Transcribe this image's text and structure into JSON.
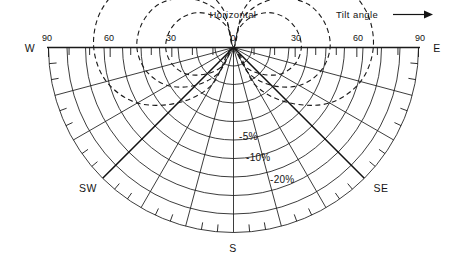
{
  "figure": {
    "title_top": "Horizontal",
    "legend_note": "Tilt angle",
    "legend_arrow_icon": "right-arrow-icon"
  },
  "axis": {
    "tick_labels": [
      "90",
      "60",
      "30",
      "0",
      "30",
      "60",
      "90"
    ],
    "tick_values": [
      -90,
      -60,
      -30,
      0,
      30,
      60,
      90
    ],
    "minor_tick_step_deg": 10
  },
  "compass": {
    "west": "W",
    "southwest": "SW",
    "south": "S",
    "southeast": "SE",
    "east": "E"
  },
  "contours": [
    {
      "label": "-5%",
      "loss_pct": 5
    },
    {
      "label": "-10%",
      "loss_pct": 10
    },
    {
      "label": "-20%",
      "loss_pct": 20
    }
  ],
  "colors": {
    "ink": "#1a1a1a",
    "background": "#ffffff"
  },
  "chart_data": {
    "type": "line",
    "title": "Horizontal",
    "subtitle": "Tilt angle",
    "projection": "polar-semicircle",
    "xlabel": "Tilt angle (degrees)",
    "ylabel": "Azimuth (compass direction)",
    "grid": true,
    "legend_position": "inline-annotations",
    "axis_ranges": {
      "tilt_deg": [
        0,
        90
      ],
      "azimuth_deg": [
        -90,
        90
      ]
    },
    "radial_tick_labels": [
      "90",
      "60",
      "30",
      "0",
      "30",
      "60",
      "90"
    ],
    "radial_tick_values": [
      -90,
      -60,
      -30,
      0,
      30,
      60,
      90
    ],
    "azimuth_tick_labels": [
      "W",
      "SW",
      "S",
      "SE",
      "E"
    ],
    "azimuth_tick_values": [
      -90,
      -45,
      0,
      45,
      90
    ],
    "grid_arcs_tilt_deg": [
      9,
      18,
      27,
      36,
      45,
      54,
      63,
      72,
      81,
      90
    ],
    "grid_rays_azimuth_deg": [
      -90,
      -75,
      -60,
      -45,
      -30,
      -15,
      0,
      15,
      30,
      45,
      60,
      75,
      90
    ],
    "major_rays_azimuth_deg": [
      -45,
      45
    ],
    "series": [
      {
        "name": "-5%",
        "annotation": "-5%",
        "style": "dashed",
        "closed": true,
        "points_polar_tilt_azimuth": [
          [
            0,
            0
          ],
          [
            10,
            30
          ],
          [
            18,
            45
          ],
          [
            26,
            60
          ],
          [
            31,
            75
          ],
          [
            33,
            90
          ],
          [
            32,
            105
          ],
          [
            29,
            120
          ],
          [
            24,
            135
          ],
          [
            17,
            150
          ],
          [
            9,
            165
          ],
          [
            0,
            180
          ],
          [
            9,
            195
          ],
          [
            17,
            210
          ],
          [
            24,
            225
          ],
          [
            29,
            240
          ],
          [
            32,
            255
          ],
          [
            33,
            270
          ],
          [
            31,
            285
          ],
          [
            26,
            300
          ],
          [
            18,
            315
          ],
          [
            10,
            330
          ]
        ]
      },
      {
        "name": "-10%",
        "annotation": "-10%",
        "style": "dashed",
        "closed": true,
        "points_polar_tilt_azimuth": [
          [
            0,
            0
          ],
          [
            14,
            30
          ],
          [
            26,
            45
          ],
          [
            37,
            60
          ],
          [
            44,
            75
          ],
          [
            47,
            90
          ],
          [
            46,
            105
          ],
          [
            42,
            120
          ],
          [
            34,
            135
          ],
          [
            24,
            150
          ],
          [
            13,
            165
          ],
          [
            0,
            180
          ],
          [
            13,
            195
          ],
          [
            24,
            210
          ],
          [
            34,
            225
          ],
          [
            42,
            240
          ],
          [
            46,
            255
          ],
          [
            47,
            270
          ],
          [
            44,
            285
          ],
          [
            37,
            300
          ],
          [
            26,
            315
          ],
          [
            14,
            330
          ]
        ]
      },
      {
        "name": "-20%",
        "annotation": "-20%",
        "style": "dashed",
        "closed": true,
        "points_polar_tilt_azimuth": [
          [
            0,
            0
          ],
          [
            21,
            30
          ],
          [
            38,
            45
          ],
          [
            54,
            60
          ],
          [
            64,
            75
          ],
          [
            68,
            90
          ],
          [
            67,
            105
          ],
          [
            61,
            120
          ],
          [
            50,
            135
          ],
          [
            35,
            150
          ],
          [
            19,
            165
          ],
          [
            0,
            180
          ],
          [
            19,
            195
          ],
          [
            35,
            210
          ],
          [
            50,
            225
          ],
          [
            61,
            240
          ],
          [
            67,
            255
          ],
          [
            68,
            270
          ],
          [
            64,
            285
          ],
          [
            54,
            300
          ],
          [
            38,
            315
          ],
          [
            21,
            330
          ]
        ]
      }
    ]
  }
}
